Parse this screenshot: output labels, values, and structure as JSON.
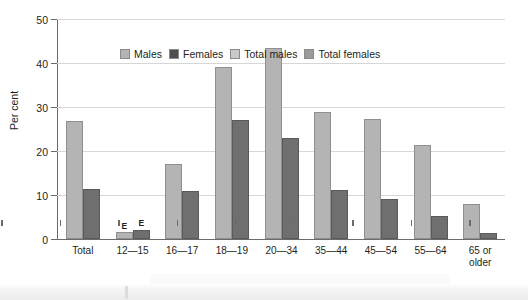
{
  "chart_data": {
    "type": "bar",
    "title": "",
    "xlabel": "Age group",
    "ylabel": "Per cent",
    "ylim": [
      0,
      50
    ],
    "yticks": [
      0,
      10,
      20,
      30,
      40,
      50
    ],
    "grid": true,
    "legend_position": "top-left inside plot",
    "categories": [
      "Total",
      "12—15",
      "16—17",
      "18—19",
      "20—34",
      "35—44",
      "45—54",
      "55—64",
      "65 or\nolder"
    ],
    "category_labels": [
      {
        "line1": "Total",
        "line2": ""
      },
      {
        "line1": "12—15",
        "line2": ""
      },
      {
        "line1": "16—17",
        "line2": ""
      },
      {
        "line1": "18—19",
        "line2": ""
      },
      {
        "line1": "20—34",
        "line2": ""
      },
      {
        "line1": "35—44",
        "line2": ""
      },
      {
        "line1": "45—54",
        "line2": ""
      },
      {
        "line1": "55—64",
        "line2": ""
      },
      {
        "line1": "65 or",
        "line2": "older"
      }
    ],
    "series": [
      {
        "name": "Males",
        "color": "#b4b4b4",
        "values": [
          27.0,
          1.5,
          17.0,
          39.2,
          43.5,
          29.0,
          27.3,
          21.5,
          8.0
        ],
        "flags": [
          "",
          "E",
          "",
          "",
          "",
          "",
          "",
          "",
          ""
        ]
      },
      {
        "name": "Females",
        "color": "#6f6f6f",
        "values": [
          11.4,
          2.0,
          10.8,
          27.2,
          23.0,
          11.1,
          9.0,
          5.2,
          1.3
        ],
        "flags": [
          "",
          "E",
          "",
          "",
          "",
          "",
          "",
          "",
          ""
        ]
      }
    ]
  },
  "legend": {
    "items": [
      {
        "label": "Males",
        "color": "#b4b4b4"
      },
      {
        "label": "Females",
        "color": "#4f4f4f"
      },
      {
        "label": "Total males",
        "color": "#c9c9c9"
      },
      {
        "label": "Total females",
        "color": "#9a9a9a"
      }
    ]
  },
  "axes": {
    "y_title": "Per cent",
    "x_title": "Age group",
    "y_tick_labels": [
      "0",
      "10",
      "20",
      "30",
      "40",
      "50"
    ]
  }
}
